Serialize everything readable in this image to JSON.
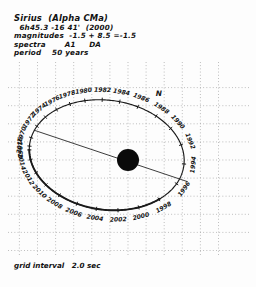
{
  "header": {
    "title": "Sirius  (Alpha CMa)",
    "coords": "  6h45.3 -16 41'  (2000)",
    "magnitudes": "magnitudes  -1.5 + 8.5 =-1.5",
    "spectra": "spectra       A1     DA",
    "period": "period    50 years"
  },
  "footer": {
    "grid_interval": "grid interval   2.0 sec"
  },
  "compass": {
    "north_label": "N"
  },
  "colors": {
    "orbit": "#1a1a1a",
    "grid": "#9a9a9a",
    "star": "#0a0a0a",
    "text": "#151515",
    "background": "#fdfdfd"
  },
  "chart_data": {
    "type": "scatter",
    "title": "Sirius  (Alpha CMa)",
    "subtitle": "Binary star apparent orbit of companion about primary",
    "xlabel": "",
    "ylabel": "",
    "grid": true,
    "grid_interval_arcsec": 2.0,
    "period_years": 50,
    "legend_position": "none",
    "xlim": [
      -12.0,
      10.0
    ],
    "ylim": [
      -10.0,
      8.0
    ],
    "primary_star": {
      "label": "",
      "x": 0.0,
      "y": 0.0,
      "radius_px": 11
    },
    "orbit_ellipse": {
      "center_x": -2.35,
      "center_y": 0.55,
      "semi_major": 8.6,
      "semi_minor": 6.05,
      "rotation_deg": -8
    },
    "apsides_line": {
      "x1": -10.4,
      "y1": 3.3,
      "x2": 6.6,
      "y2": -2.4
    },
    "categories": [
      "1968",
      "1970",
      "1972",
      "1974",
      "1976",
      "1978",
      "1980",
      "1982",
      "1984",
      "1986",
      "1988",
      "1990",
      "1992",
      "1994",
      "1996",
      "1998",
      "2000",
      "2002",
      "2004",
      "2006",
      "2008",
      "2010",
      "2012",
      "2014",
      "2016"
    ],
    "values": [
      {
        "year": "1968",
        "angle_deg": 186,
        "label_side": "left"
      },
      {
        "year": "1970",
        "angle_deg": 173,
        "label_side": "left"
      },
      {
        "year": "1972",
        "angle_deg": 160,
        "label_side": "left"
      },
      {
        "year": "1974",
        "angle_deg": 148,
        "label_side": "left"
      },
      {
        "year": "1976",
        "angle_deg": 136,
        "label_side": "top"
      },
      {
        "year": "1978",
        "angle_deg": 124,
        "label_side": "top"
      },
      {
        "year": "1980",
        "angle_deg": 112,
        "label_side": "top"
      },
      {
        "year": "1982",
        "angle_deg": 99,
        "label_side": "top"
      },
      {
        "year": "1984",
        "angle_deg": 86,
        "label_side": "top"
      },
      {
        "year": "1986",
        "angle_deg": 72,
        "label_side": "top"
      },
      {
        "year": "1988",
        "angle_deg": 56,
        "label_side": "right"
      },
      {
        "year": "1990",
        "angle_deg": 40,
        "label_side": "right"
      },
      {
        "year": "1992",
        "angle_deg": 22,
        "label_side": "right"
      },
      {
        "year": "1994",
        "angle_deg": 2,
        "label_side": "right"
      },
      {
        "year": "1996",
        "angle_deg": -20,
        "label_side": "right"
      },
      {
        "year": "1998",
        "angle_deg": -42,
        "label_side": "bottom"
      },
      {
        "year": "2000",
        "angle_deg": -60,
        "label_side": "bottom"
      },
      {
        "year": "2002",
        "angle_deg": -76,
        "label_side": "bottom"
      },
      {
        "year": "2004",
        "angle_deg": -92,
        "label_side": "bottom"
      },
      {
        "year": "2006",
        "angle_deg": -107,
        "label_side": "bottom"
      },
      {
        "year": "2008",
        "angle_deg": -122,
        "label_side": "bottom"
      },
      {
        "year": "2010",
        "angle_deg": -136,
        "label_side": "left"
      },
      {
        "year": "2012",
        "angle_deg": -150,
        "label_side": "left"
      },
      {
        "year": "2014",
        "angle_deg": -164,
        "label_side": "left"
      },
      {
        "year": "2016",
        "angle_deg": -178,
        "label_side": "left"
      }
    ],
    "annotations": [
      {
        "text": "N",
        "x": 3.4,
        "y": 7.1
      },
      {
        "text": "grid interval   2.0 sec",
        "x": -11.4,
        "y": -9.3
      }
    ]
  }
}
